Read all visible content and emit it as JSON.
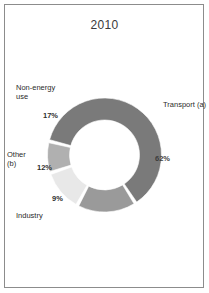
{
  "figure": {
    "title": "2010",
    "border_color": "#8c8c8c",
    "background": "#ffffff"
  },
  "chart_data": {
    "type": "pie",
    "variant": "donut",
    "title": "2010",
    "xlabel": "",
    "ylabel": "",
    "legend_position": "none",
    "labels_outside": true,
    "categories": [
      "Transport (a)",
      "Non-energy use",
      "Other (b)",
      "Industry"
    ],
    "values": [
      62,
      17,
      12,
      9
    ],
    "value_labels": [
      "62%",
      "17%",
      "12%",
      "9%"
    ],
    "colors": [
      "#7a7a7a",
      "#9a9a9a",
      "#e8e8e8",
      "#b0b0b0"
    ],
    "total": 100,
    "units": "percent",
    "slices": [
      {
        "name": "Transport (a)",
        "value": 62,
        "label": "62%",
        "color": "#7a7a7a"
      },
      {
        "name": "Non-energy use",
        "value": 17,
        "label": "17%",
        "color": "#9a9a9a"
      },
      {
        "name": "Other (b)",
        "value": 12,
        "label": "12%",
        "color": "#e8e8e8"
      },
      {
        "name": "Industry",
        "value": 9,
        "label": "9%",
        "color": "#b0b0b0"
      }
    ]
  },
  "labels": {
    "transport": "Transport (a)",
    "nonenergy_line1": "Non-energy",
    "nonenergy_line2": "use",
    "other_line1": "Other",
    "other_line2": "(b)",
    "industry": "Industry",
    "pct_transport": "62%",
    "pct_nonenergy": "17%",
    "pct_other": "12%",
    "pct_industry": "9%"
  }
}
